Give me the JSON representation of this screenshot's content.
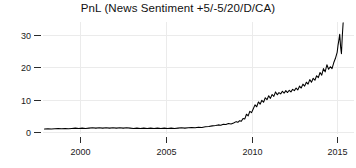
{
  "chart_data": {
    "type": "line",
    "title": "PnL (News Sentiment +5/-5/20/D/CA)",
    "xlabel": "",
    "ylabel": "",
    "xlim": [
      1997.9,
      2015.4
    ],
    "ylim": [
      -1.5,
      35.5
    ],
    "xticks": [
      2000,
      2005,
      2010,
      2015
    ],
    "xticklabels": [
      "2000",
      "2005",
      "2010",
      "2015"
    ],
    "yticks": [
      0,
      10,
      20,
      30
    ],
    "yticklabels": [
      "0",
      "10",
      "20",
      "30"
    ],
    "grid": true,
    "legend": null,
    "series": [
      {
        "name": "PnL",
        "color": "#000000",
        "x": [
          1997.9,
          1998.1,
          1998.3,
          1998.5,
          1998.7,
          1998.9,
          1999.1,
          1999.3,
          1999.5,
          1999.7,
          1999.9,
          2000.1,
          2000.3,
          2000.5,
          2000.7,
          2000.9,
          2001.1,
          2001.3,
          2001.5,
          2001.7,
          2001.9,
          2002.1,
          2002.3,
          2002.5,
          2002.7,
          2002.9,
          2003.1,
          2003.3,
          2003.5,
          2003.7,
          2003.9,
          2004.1,
          2004.3,
          2004.5,
          2004.7,
          2004.9,
          2005.1,
          2005.3,
          2005.5,
          2005.7,
          2005.9,
          2006.1,
          2006.3,
          2006.5,
          2006.7,
          2006.9,
          2007.1,
          2007.3,
          2007.5,
          2007.7,
          2007.9,
          2008.05,
          2008.2,
          2008.35,
          2008.5,
          2008.65,
          2008.8,
          2008.95,
          2009.1,
          2009.2,
          2009.3,
          2009.4,
          2009.5,
          2009.6,
          2009.7,
          2009.8,
          2009.9,
          2010.0,
          2010.1,
          2010.2,
          2010.3,
          2010.4,
          2010.5,
          2010.6,
          2010.7,
          2010.8,
          2010.9,
          2011.0,
          2011.1,
          2011.2,
          2011.3,
          2011.4,
          2011.5,
          2011.6,
          2011.7,
          2011.8,
          2011.9,
          2012.0,
          2012.1,
          2012.2,
          2012.3,
          2012.4,
          2012.5,
          2012.6,
          2012.7,
          2012.8,
          2012.9,
          2013.0,
          2013.1,
          2013.2,
          2013.3,
          2013.4,
          2013.5,
          2013.6,
          2013.7,
          2013.8,
          2013.9,
          2014.0,
          2014.1,
          2014.2,
          2014.3,
          2014.4,
          2014.5,
          2014.6,
          2014.7,
          2014.8,
          2014.9,
          2015.0,
          2015.05,
          2015.1,
          2015.15,
          2015.2,
          2015.25,
          2015.3,
          2015.35
        ],
        "y": [
          0.9,
          1.0,
          0.9,
          1.0,
          1.1,
          1.0,
          1.1,
          1.0,
          1.1,
          1.2,
          1.1,
          1.2,
          1.1,
          1.2,
          1.3,
          1.2,
          1.3,
          1.2,
          1.3,
          1.2,
          1.3,
          1.2,
          1.3,
          1.2,
          1.3,
          1.2,
          1.1,
          1.2,
          1.1,
          1.2,
          1.1,
          1.2,
          1.1,
          1.2,
          1.1,
          1.2,
          1.1,
          1.2,
          1.1,
          1.2,
          1.3,
          1.2,
          1.3,
          1.4,
          1.3,
          1.5,
          1.4,
          1.6,
          1.7,
          1.9,
          2.0,
          2.2,
          2.1,
          2.4,
          2.3,
          2.6,
          2.5,
          2.8,
          3.2,
          3.0,
          3.5,
          3.3,
          4.2,
          4.0,
          5.5,
          5.0,
          6.4,
          6.0,
          7.2,
          8.4,
          7.8,
          9.3,
          8.6,
          9.8,
          9.2,
          10.6,
          10.0,
          11.2,
          10.4,
          11.6,
          11.0,
          12.4,
          11.5,
          12.2,
          11.8,
          12.6,
          12.0,
          12.8,
          12.2,
          12.9,
          12.4,
          13.2,
          12.8,
          13.6,
          13.0,
          14.2,
          13.6,
          14.8,
          14.2,
          15.4,
          14.8,
          16.2,
          15.4,
          16.6,
          16.0,
          17.4,
          16.8,
          18.4,
          17.6,
          19.6,
          18.6,
          20.8,
          19.4,
          20.2,
          19.6,
          21.4,
          22.8,
          24.6,
          26.8,
          28.4,
          30.2,
          26.4,
          24.2,
          29.6,
          33.8
        ]
      }
    ]
  },
  "axes": {
    "y_tick_label_0": "0",
    "y_tick_label_1": "10",
    "y_tick_label_2": "20",
    "y_tick_label_3": "30",
    "x_tick_label_0": "2000",
    "x_tick_label_1": "2005",
    "x_tick_label_2": "2010",
    "x_tick_label_3": "2015"
  },
  "colors": {
    "line": "#000000",
    "grid": "#ebebeb",
    "text": "#111111",
    "background": "#ffffff"
  }
}
